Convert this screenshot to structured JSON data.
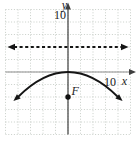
{
  "figure": {
    "width": 139,
    "height": 141,
    "background": "#ffffff"
  },
  "labels": {
    "x_axis": "x",
    "y_axis": "y",
    "x_tick": "10",
    "y_tick": "10",
    "focus": "F"
  },
  "colors": {
    "grid": "#c3c9c3",
    "x_axis": "#8e8e8e",
    "y_axis": "#3f3f3f",
    "curve": "#151515",
    "directrix": "#151515",
    "point": "#111111",
    "text": "#1c1c1c"
  },
  "chart_data": {
    "type": "line",
    "xlabel": "x",
    "ylabel": "y",
    "xlim": [
      -12.5,
      12.5
    ],
    "ylim": [
      -12.5,
      12.5
    ],
    "grid": true,
    "grid_step": 2.5,
    "x_ticks": [
      {
        "value": 10,
        "label": "10"
      }
    ],
    "y_ticks": [
      {
        "value": 10,
        "label": "10"
      }
    ],
    "series": [
      {
        "name": "directrix",
        "kind": "horizontal-line",
        "y": 5,
        "x_span": [
          -12,
          12
        ],
        "style": "dashed",
        "arrows": "both"
      },
      {
        "name": "parabola",
        "kind": "quadratic",
        "equation": "y = -x^2/20",
        "a": -0.05,
        "vertex": [
          0,
          0
        ],
        "x_span": [
          -10,
          10
        ],
        "sample_points": [
          [
            -10,
            -5
          ],
          [
            0,
            0
          ],
          [
            10,
            -5
          ]
        ],
        "style": "solid",
        "arrows": "both"
      }
    ],
    "points": [
      {
        "name": "focus",
        "label": "F",
        "coords": [
          0,
          -5
        ]
      }
    ]
  }
}
